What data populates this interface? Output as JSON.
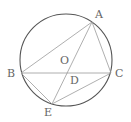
{
  "diagram": {
    "colors": {
      "circle": "#555555",
      "lines": "#9a9a9a",
      "labels": "#666666",
      "background": "#ffffff"
    },
    "circle": {
      "center": "O",
      "cx": 66,
      "cy": 60,
      "r": 46
    },
    "points": {
      "A": {
        "label": "A",
        "x": 92,
        "y": 22,
        "lx": 95,
        "ly": 18
      },
      "B": {
        "label": "B",
        "x": 21,
        "y": 73,
        "lx": 7,
        "ly": 77
      },
      "C": {
        "label": "C",
        "x": 111,
        "y": 73,
        "lx": 115,
        "ly": 77
      },
      "D": {
        "label": "D",
        "x": 67,
        "y": 73,
        "lx": 70,
        "ly": 84
      },
      "E": {
        "label": "E",
        "x": 52,
        "y": 104,
        "lx": 44,
        "ly": 116
      },
      "O": {
        "label": "O",
        "x": 66,
        "y": 60,
        "lx": 60,
        "ly": 64
      }
    },
    "segments": [
      "AB",
      "AC",
      "AE",
      "BC",
      "BE",
      "CE"
    ]
  }
}
